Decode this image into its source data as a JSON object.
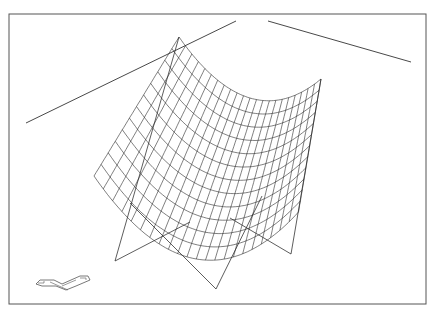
{
  "viewport": {
    "title": "",
    "frame": {
      "x": 9,
      "y": 14,
      "width": 417,
      "height": 290,
      "stroke": "#555555"
    },
    "line_color": "#333333",
    "mesh_color": "#2a2a2a",
    "reference_lines": [
      {
        "x1": 26,
        "y1": 123,
        "x2": 236,
        "y2": 21
      },
      {
        "x1": 268,
        "y1": 21,
        "x2": 411,
        "y2": 62
      }
    ],
    "surface": {
      "corners": {
        "top": [
          179,
          37
        ],
        "right": [
          321,
          79
        ],
        "left": [
          94,
          176
        ],
        "bottom": [
          196,
          222
        ]
      },
      "u_divisions": 22,
      "v_divisions": 12
    },
    "support_frame": {
      "points": [
        [
          179,
          37
        ],
        [
          115,
          261
        ],
        [
          216,
          289
        ],
        [
          291,
          254
        ],
        [
          321,
          79
        ]
      ],
      "inner_lines": [
        {
          "x1": 130,
          "y1": 203,
          "x2": 216,
          "y2": 289
        },
        {
          "x1": 115,
          "y1": 261,
          "x2": 190,
          "y2": 222
        },
        {
          "x1": 262,
          "y1": 196,
          "x2": 216,
          "y2": 289
        },
        {
          "x1": 230,
          "y1": 218,
          "x2": 291,
          "y2": 254
        }
      ]
    },
    "ucs_icon": {
      "name": "ucs-icon",
      "x": 36,
      "y": 276
    }
  }
}
